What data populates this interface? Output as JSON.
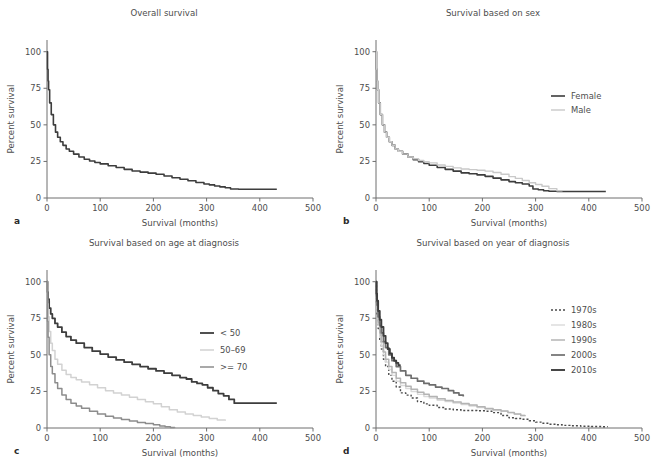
{
  "figure": {
    "panels": [
      {
        "key": "a",
        "label": "a",
        "title": "Overall survival",
        "xlabel": "Survival (months)",
        "ylabel": "Percent survival"
      },
      {
        "key": "b",
        "label": "b",
        "title": "Survival based on sex",
        "xlabel": "Survival (months)",
        "ylabel": "Percent survival"
      },
      {
        "key": "c",
        "label": "c",
        "title": "Survival based on age at diagnosis",
        "xlabel": "Survival (months)",
        "ylabel": "Percent survival"
      },
      {
        "key": "d",
        "label": "d",
        "title": "Survival based on year of diagnosis",
        "xlabel": "Survival (months)",
        "ylabel": "Percent survival"
      }
    ]
  },
  "chart_data": [
    {
      "panel": "a",
      "type": "line",
      "title": "Overall survival",
      "xlabel": "Survival (months)",
      "ylabel": "Percent survival",
      "xlim": [
        0,
        500
      ],
      "ylim": [
        0,
        108
      ],
      "xticks": [
        0,
        100,
        200,
        300,
        400,
        500
      ],
      "yticks": [
        0,
        25,
        50,
        75,
        100
      ],
      "grid": false,
      "legend": null,
      "series": [
        {
          "name": "Overall",
          "color": "#3d3d3d",
          "width": 1.6,
          "dash": "none",
          "x": [
            0,
            1,
            2,
            3,
            5,
            8,
            12,
            16,
            20,
            25,
            30,
            36,
            42,
            50,
            60,
            70,
            80,
            90,
            100,
            115,
            130,
            145,
            160,
            175,
            190,
            205,
            220,
            235,
            250,
            265,
            280,
            295,
            305,
            315,
            325,
            335,
            345,
            360,
            380,
            400,
            420,
            432
          ],
          "y": [
            100,
            88,
            80,
            74,
            65,
            57,
            50,
            45,
            41.5,
            38.5,
            36,
            33.5,
            32,
            30,
            28,
            26.5,
            25.3,
            24.3,
            23.3,
            22,
            20.8,
            19.6,
            18.5,
            17.7,
            17,
            16.2,
            15,
            13.8,
            12.8,
            11.8,
            10.6,
            9.6,
            9.0,
            8.2,
            7.6,
            7.0,
            6.2,
            6.0,
            6.0,
            6.0,
            6.0,
            6.0
          ]
        }
      ]
    },
    {
      "panel": "b",
      "type": "line",
      "title": "Survival based on sex",
      "xlabel": "Survival (months)",
      "ylabel": "Percent survival",
      "xlim": [
        0,
        500
      ],
      "ylim": [
        0,
        108
      ],
      "xticks": [
        0,
        100,
        200,
        300,
        400,
        500
      ],
      "yticks": [
        0,
        25,
        50,
        75,
        100
      ],
      "grid": false,
      "legend": {
        "position": "right-upper",
        "entries": [
          "Female",
          "Male"
        ]
      },
      "series": [
        {
          "name": "Female",
          "color": "#3d3d3d",
          "width": 1.6,
          "dash": "none",
          "x": [
            0,
            1,
            2,
            3,
            5,
            8,
            12,
            16,
            20,
            25,
            30,
            36,
            42,
            50,
            60,
            70,
            80,
            90,
            100,
            115,
            130,
            145,
            160,
            175,
            190,
            205,
            220,
            235,
            250,
            262,
            275,
            288,
            295,
            305,
            315,
            325,
            340,
            360,
            390,
            420,
            432
          ],
          "y": [
            100,
            88,
            80,
            74,
            65,
            57,
            50,
            45,
            41.5,
            38.5,
            36,
            33.5,
            32,
            30,
            28,
            26.2,
            24.8,
            23.6,
            22.4,
            20.8,
            19.6,
            18.4,
            17.2,
            16.6,
            15.8,
            14.8,
            13.6,
            12.4,
            11.2,
            10.4,
            9.6,
            8.2,
            6.2,
            5.6,
            5.0,
            4.6,
            4.4,
            4.4,
            4.4,
            4.4,
            4.4
          ]
        },
        {
          "name": "Male",
          "color": "#c9c9c9",
          "width": 1.4,
          "dash": "none",
          "x": [
            0,
            1,
            2,
            3,
            5,
            8,
            12,
            16,
            20,
            25,
            30,
            36,
            42,
            50,
            60,
            70,
            80,
            90,
            100,
            115,
            130,
            145,
            160,
            175,
            190,
            205,
            220,
            235,
            250,
            262,
            275,
            288,
            300,
            312,
            325,
            340,
            350
          ],
          "y": [
            100,
            88,
            80,
            74,
            65,
            57,
            50,
            45,
            41.5,
            38.5,
            36,
            33.5,
            32,
            30,
            28,
            26.8,
            25.6,
            24.8,
            24.0,
            22.6,
            21.6,
            20.6,
            19.8,
            19.4,
            19.0,
            18.4,
            17.4,
            16.2,
            14.6,
            13.4,
            12.0,
            10.4,
            9.2,
            8.0,
            6.4,
            5.0,
            4.6
          ]
        }
      ]
    },
    {
      "panel": "c",
      "type": "line",
      "title": "Survival based on age at diagnosis",
      "xlabel": "Survival (months)",
      "ylabel": "Percent survival",
      "xlim": [
        0,
        500
      ],
      "ylim": [
        0,
        108
      ],
      "xticks": [
        0,
        100,
        200,
        300,
        400,
        500
      ],
      "yticks": [
        0,
        25,
        50,
        75,
        100
      ],
      "grid": false,
      "legend": {
        "position": "center-right",
        "entries": [
          "< 50",
          "50–69",
          ">= 70"
        ]
      },
      "series": [
        {
          "name": "< 50",
          "color": "#3d3d3d",
          "width": 1.8,
          "dash": "none",
          "x": [
            0,
            1,
            2,
            4,
            7,
            10,
            15,
            20,
            28,
            36,
            45,
            55,
            70,
            85,
            100,
            115,
            130,
            145,
            160,
            175,
            190,
            205,
            220,
            235,
            250,
            262,
            272,
            282,
            292,
            302,
            312,
            322,
            332,
            342,
            352,
            370,
            395,
            420,
            432
          ],
          "y": [
            100,
            93,
            88,
            82,
            78,
            75,
            71.5,
            69,
            65.5,
            62.5,
            60,
            58,
            55,
            52.5,
            50.5,
            48.5,
            46.5,
            45,
            43.5,
            42,
            40.5,
            39,
            37.5,
            36,
            34.5,
            33.5,
            31.5,
            30.5,
            29.5,
            27.5,
            25.5,
            23.5,
            22,
            19.5,
            17,
            17,
            17,
            17,
            17
          ]
        },
        {
          "name": "50–69",
          "color": "#d2d2d2",
          "width": 1.5,
          "dash": "none",
          "x": [
            0,
            1,
            2,
            4,
            7,
            10,
            15,
            20,
            28,
            36,
            45,
            55,
            65,
            80,
            95,
            110,
            125,
            140,
            155,
            170,
            185,
            200,
            215,
            230,
            245,
            260,
            275,
            290,
            305,
            320,
            335
          ],
          "y": [
            100,
            85,
            76,
            66,
            58,
            53,
            47,
            43.5,
            39.5,
            36.5,
            34.5,
            33,
            31.5,
            29.5,
            27.5,
            25.5,
            24,
            22.5,
            21,
            19.5,
            18,
            16.5,
            14.5,
            12.5,
            11,
            9.5,
            8.5,
            7.5,
            6.5,
            5.5,
            5
          ]
        },
        {
          "name": ">= 70",
          "color": "#8c8c8c",
          "width": 1.5,
          "dash": "none",
          "x": [
            0,
            1,
            2,
            4,
            7,
            10,
            15,
            20,
            28,
            36,
            45,
            55,
            65,
            80,
            95,
            110,
            125,
            140,
            155,
            170,
            185,
            200,
            212,
            222,
            232,
            240
          ],
          "y": [
            100,
            73,
            62,
            50,
            42,
            37,
            31,
            27,
            22.5,
            19.5,
            17,
            15,
            13.5,
            11.5,
            9.5,
            8,
            6.8,
            5.8,
            4.8,
            3.8,
            3.0,
            2.2,
            1.4,
            0.8,
            0.4,
            0.2
          ]
        }
      ]
    },
    {
      "panel": "d",
      "type": "line",
      "title": "Survival based on year of diagnosis",
      "xlabel": "Survival (months)",
      "ylabel": "Percent survival",
      "xlim": [
        0,
        500
      ],
      "ylim": [
        0,
        108
      ],
      "xticks": [
        0,
        100,
        200,
        300,
        400,
        500
      ],
      "yticks": [
        0,
        25,
        50,
        75,
        100
      ],
      "grid": false,
      "legend": {
        "position": "right-upper",
        "entries": [
          "1970s",
          "1980s",
          "1990s",
          "2000s",
          "2010s"
        ]
      },
      "series": [
        {
          "name": "1970s",
          "color": "#4a4a4a",
          "width": 1.4,
          "dash": "2,2",
          "x": [
            0,
            1,
            2,
            4,
            7,
            10,
            14,
            18,
            24,
            30,
            38,
            46,
            56,
            66,
            78,
            90,
            100,
            115,
            130,
            145,
            160,
            175,
            190,
            205,
            220,
            235,
            250,
            262,
            275,
            288,
            300,
            312,
            325,
            338,
            350,
            365,
            385,
            405,
            425,
            435
          ],
          "y": [
            100,
            86,
            78,
            68,
            60,
            54,
            47,
            42,
            36,
            32,
            28,
            24,
            22.5,
            20.5,
            18,
            16.5,
            15.5,
            14,
            13,
            12.5,
            12,
            12,
            11.8,
            11.5,
            10.5,
            8.5,
            7,
            6.5,
            6,
            5,
            4,
            3.2,
            2.6,
            2.2,
            1.8,
            1.5,
            1.2,
            1.0,
            0.9,
            0.8
          ]
        },
        {
          "name": "1980s",
          "color": "#dadada",
          "width": 1.4,
          "dash": "none",
          "x": [
            0,
            1,
            2,
            4,
            7,
            10,
            14,
            18,
            24,
            30,
            38,
            46,
            56,
            66,
            78,
            90,
            100,
            115,
            130,
            145,
            160,
            175,
            190,
            205,
            220,
            235,
            248,
            260,
            272,
            280
          ],
          "y": [
            100,
            88,
            80,
            70,
            62,
            56,
            50,
            45,
            40,
            36,
            32,
            29,
            27,
            25,
            23,
            21.5,
            20.5,
            19,
            18,
            17,
            16,
            15,
            14,
            13,
            12,
            11.5,
            10.5,
            9.5,
            8.5,
            8
          ]
        },
        {
          "name": "1990s",
          "color": "#b4b4b4",
          "width": 1.5,
          "dash": "none",
          "x": [
            0,
            1,
            2,
            4,
            7,
            10,
            14,
            18,
            24,
            30,
            38,
            46,
            56,
            66,
            78,
            90,
            100,
            115,
            130,
            145,
            160,
            175,
            190,
            205,
            220,
            235,
            248,
            260,
            272,
            280
          ],
          "y": [
            100,
            89,
            82,
            72,
            65,
            59,
            52,
            47,
            42,
            38,
            34,
            31,
            28.5,
            26.5,
            24.5,
            23,
            21.5,
            20,
            18.8,
            17.8,
            16.8,
            15.8,
            14.6,
            13.4,
            12.4,
            11.6,
            10.6,
            9.6,
            8.6,
            8
          ]
        },
        {
          "name": "2000s",
          "color": "#6e6e6e",
          "width": 1.7,
          "dash": "none",
          "x": [
            0,
            1,
            2,
            4,
            7,
            10,
            14,
            18,
            24,
            30,
            38,
            46,
            56,
            66,
            78,
            90,
            100,
            112,
            124,
            136,
            146,
            156,
            164
          ],
          "y": [
            100,
            90,
            84,
            76,
            70,
            65,
            59,
            55,
            50,
            46,
            42,
            39,
            36,
            34,
            32,
            30.5,
            29.5,
            28,
            27,
            25.5,
            24,
            22.5,
            21.5
          ]
        },
        {
          "name": "2010s",
          "color": "#3d3d3d",
          "width": 1.9,
          "dash": "none",
          "x": [
            0,
            1,
            2,
            4,
            7,
            10,
            14,
            18,
            22,
            26,
            30,
            34,
            38,
            42,
            45
          ],
          "y": [
            100,
            92,
            87,
            80,
            74,
            69,
            63,
            58,
            54,
            51,
            48,
            46,
            44.5,
            43,
            42.5
          ]
        }
      ]
    }
  ]
}
